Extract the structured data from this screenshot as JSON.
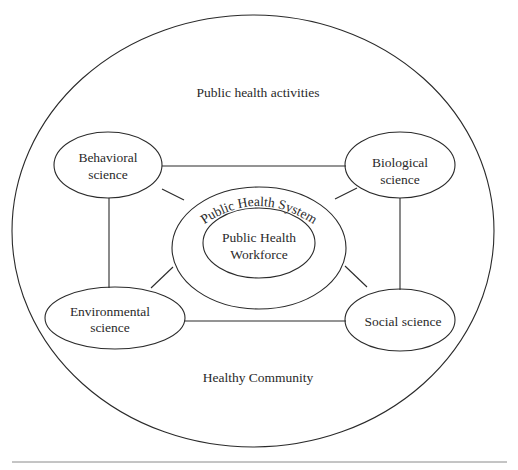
{
  "diagram": {
    "outer": {
      "top_label": "Public health activities",
      "bottom_label": "Healthy Community"
    },
    "center": {
      "system_label": "Public Health System",
      "workforce_line1": "Public Health",
      "workforce_line2": "Workforce"
    },
    "nodes": [
      {
        "id": "behavioral",
        "line1": "Behavioral",
        "line2": "science"
      },
      {
        "id": "biological",
        "line1": "Biological",
        "line2": "science"
      },
      {
        "id": "environmental",
        "line1": "Environmental",
        "line2": "science"
      },
      {
        "id": "social",
        "line1": "Social science",
        "line2": ""
      }
    ],
    "colors": {
      "stroke": "#2a2a2a",
      "text": "#2a2a2a",
      "background": "#ffffff",
      "rule": "#8a8a8a"
    }
  }
}
